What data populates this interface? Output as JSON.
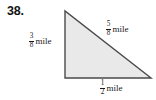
{
  "figure": {
    "problem_number": "38.",
    "shape": "right-triangle",
    "fill_color": "#e9e9e9",
    "stroke_color": "#4a4a4a",
    "background_color": "#ffffff",
    "vertices": {
      "apex": [
        65,
        11
      ],
      "bottom_left": [
        65,
        78
      ],
      "bottom_right": [
        151,
        78
      ]
    },
    "labels": {
      "left_leg": {
        "numerator": "3",
        "denominator": "8",
        "unit": "mile",
        "full_text": "3/8 mile"
      },
      "hypotenuse": {
        "numerator": "5",
        "denominator": "8",
        "unit": "mile",
        "full_text": "5/8 mile"
      },
      "bottom_leg": {
        "numerator": "1",
        "denominator": "2",
        "unit": "mile",
        "full_text": "1/2 mile"
      }
    }
  }
}
